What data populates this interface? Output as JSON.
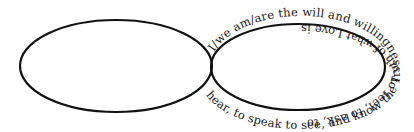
{
  "diagram": {
    "type": "infinity-loop-text",
    "stroke_color": "#111111",
    "text_color": "#1a1a1a",
    "background": "#ffffff",
    "left_loop": {
      "text": "hear, to speak to see, and know the Truth of what Love is"
    },
    "right_loop": {
      "text": "I/we am/are the will and willingness to feel, to ask, to"
    },
    "full_phrase": "I/we am/are the will and willingness to feel, to ask, to hear, to speak to see, and know the Truth of what Love is"
  }
}
